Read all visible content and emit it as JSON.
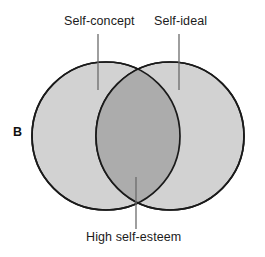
{
  "figure": {
    "panel_label": "B",
    "type": "venn-diagram",
    "background_color": "#ffffff",
    "labels": {
      "left_circle": "Self-concept",
      "right_circle": "Self-ideal",
      "overlap": "High self-esteem"
    },
    "colors": {
      "circle_fill": "#d2d2d2",
      "overlap_fill": "#acacac",
      "outline": "#1a1a1a",
      "leader_line": "#6b6b6b",
      "text": "#1b1b1b"
    },
    "geometry": {
      "left_circle": {
        "cx": 106,
        "cy": 136,
        "r": 74
      },
      "right_circle": {
        "cx": 170,
        "cy": 136,
        "r": 74
      },
      "leader_lines": [
        {
          "name": "self-concept-leader",
          "x": 98,
          "y1": 34,
          "y2": 90
        },
        {
          "name": "self-ideal-leader",
          "x": 179,
          "y1": 34,
          "y2": 90
        },
        {
          "name": "high-self-esteem-leader",
          "x": 136,
          "y1": 177,
          "y2": 229
        }
      ]
    }
  }
}
